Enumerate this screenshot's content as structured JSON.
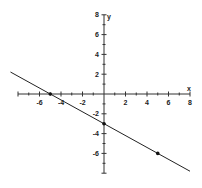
{
  "chart_data": {
    "type": "line",
    "title": "",
    "xlabel": "x",
    "ylabel": "y",
    "xlim": [
      -8,
      8
    ],
    "ylim": [
      -8,
      8
    ],
    "grid": false,
    "x_tick_labels": [
      "-6",
      "-4",
      "-2",
      "2",
      "4",
      "6",
      "8"
    ],
    "x_tick_values": [
      -6,
      -4,
      -2,
      2,
      4,
      6,
      8
    ],
    "y_tick_labels": [
      "8",
      "6",
      "4",
      "2",
      "-2",
      "-4",
      "-6"
    ],
    "y_tick_values": [
      8,
      6,
      4,
      2,
      -2,
      -4,
      -6
    ],
    "minor_tick_step": 1,
    "series": [
      {
        "name": "line",
        "equation": "y = -3/5 x - 3",
        "slope": -0.6,
        "intercept": -3,
        "x": [
          -8.7,
          8
        ],
        "y": [
          2.22,
          -7.8
        ],
        "color": "#222222"
      }
    ],
    "marked_points": [
      {
        "x": -5,
        "y": 0
      },
      {
        "x": 0,
        "y": -3
      },
      {
        "x": 5,
        "y": -6
      }
    ]
  }
}
